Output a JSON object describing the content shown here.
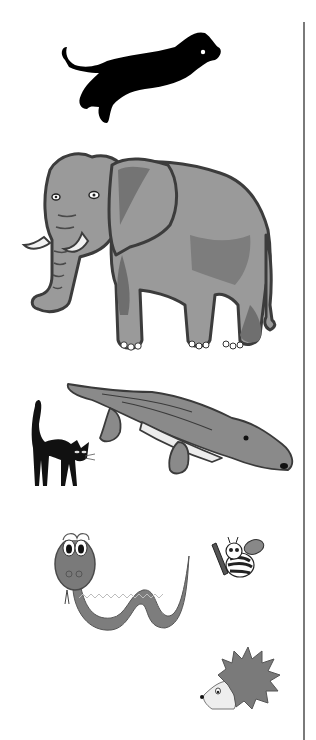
{
  "page": {
    "background": "#ffffff",
    "divider_color": "#7a7a7a"
  },
  "animals": [
    {
      "id": "panther",
      "name": "Panther",
      "style": "black silhouette, leaping",
      "color": "#000000"
    },
    {
      "id": "elephant",
      "name": "Elephant",
      "style": "grey cartoon with tusks",
      "color": "#9a9a9a"
    },
    {
      "id": "cat",
      "name": "Black cat",
      "style": "arched back",
      "color": "#111111"
    },
    {
      "id": "crocodile",
      "name": "Crocodile",
      "style": "grey cartoon",
      "color": "#8a8a8a"
    },
    {
      "id": "snake",
      "name": "Snake",
      "style": "cartoon with big eyes, zigzag pattern",
      "color": "#7d7d7d"
    },
    {
      "id": "bee",
      "name": "Bee",
      "style": "cartoon holding a pencil",
      "color": "#444444"
    },
    {
      "id": "hedgehog",
      "name": "Hedgehog",
      "style": "cartoon with spikes",
      "color": "#7a7a7a"
    }
  ]
}
